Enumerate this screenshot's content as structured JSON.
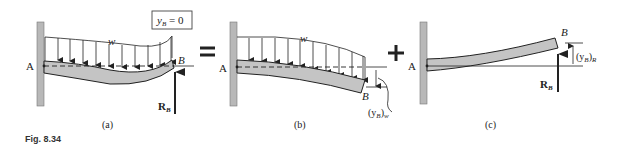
{
  "figure": {
    "caption": "Fig. 8.34",
    "operators": {
      "equals": "=",
      "plus": "+"
    },
    "panels": [
      {
        "id": "a",
        "label": "(a)",
        "support_label": "A",
        "end_label": "B",
        "load_label": "w",
        "reaction_label": "R",
        "reaction_subscript": "B",
        "condition_box": {
          "var": "y",
          "sub": "B",
          "rest": " = 0"
        }
      },
      {
        "id": "b",
        "label": "(b)",
        "support_label": "A",
        "end_label": "B",
        "load_label": "w",
        "deflection_label": {
          "open": "(y",
          "sub": "B",
          "close": ")",
          "sub2": "w"
        }
      },
      {
        "id": "c",
        "label": "(c)",
        "support_label": "A",
        "end_label": "B",
        "reaction_label": "R",
        "reaction_subscript": "B",
        "deflection_label": {
          "open": "(y",
          "sub": "B",
          "close": ")",
          "sub2": "R"
        }
      }
    ]
  },
  "colors": {
    "wall": "#b8b8b8",
    "beam": "#c4c4c4",
    "ink": "#222222",
    "background": "#ffffff"
  }
}
